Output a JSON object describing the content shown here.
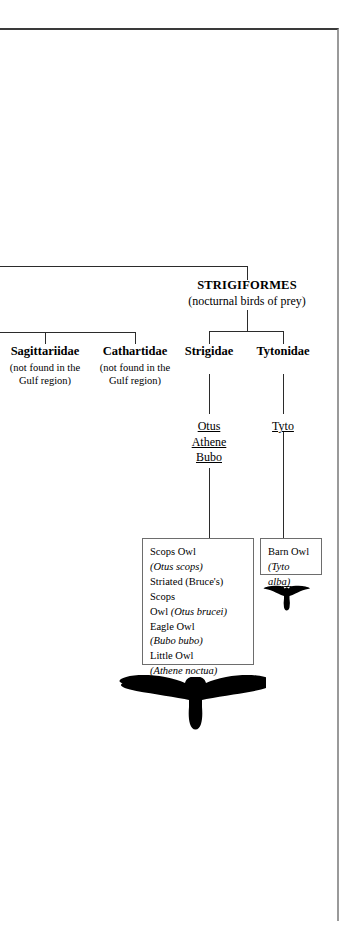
{
  "figure": {
    "order": {
      "name": "STRIGIFORMES",
      "gloss": "(nocturnal birds of prey)"
    },
    "offpage_families": [
      {
        "name": "Sagittariidae",
        "note_line1": "(not found in the",
        "note_line2": "Gulf region)"
      },
      {
        "name": "Cathartidae",
        "note_line1": "(not found in the",
        "note_line2": "Gulf region)"
      }
    ],
    "families": [
      {
        "name": "Strigidae",
        "genera": [
          "Otus",
          "Athene",
          "Bubo"
        ],
        "species": [
          {
            "common_line1": "Scops Owl",
            "common_line2": "",
            "scientific": "(Otus scops)"
          },
          {
            "common_line1": "Striated (Bruce's) Scops",
            "common_line2": "Owl ",
            "scientific": "(Otus brucei)"
          },
          {
            "common_line1": "Eagle Owl",
            "common_line2": "",
            "scientific": "(Bubo bubo)"
          },
          {
            "common_line1": "Little Owl",
            "common_line2": "",
            "scientific": "(Athene noctua)"
          }
        ],
        "silhouette": "soaring-owl-silhouette"
      },
      {
        "name": "Tytonidae",
        "genera": [
          "Tyto"
        ],
        "species": [
          {
            "common_line1": "Barn Owl",
            "common_line2": "",
            "scientific": "(Tyto alba)"
          }
        ],
        "silhouette": "flying-barn-owl-silhouette"
      }
    ],
    "colors": {
      "ink": "#000000",
      "rule": "#2b2b2b",
      "box_border": "#6d6d6d",
      "page_border": "#9a9a9a",
      "background": "#ffffff"
    }
  }
}
